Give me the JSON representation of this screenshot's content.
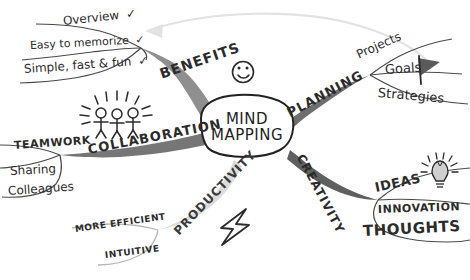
{
  "diagram": {
    "title": "Mind Mapping",
    "type": "hand-drawn mind map",
    "background_color": "#ffffff",
    "ink_color": "#2b2b2b",
    "branch_dark_color": "#6e6e6e",
    "branch_light_color": "#d8d8d8",
    "center": {
      "line1": "MIND",
      "line2": "MAPPING"
    },
    "branches": [
      {
        "label": "BENEFITS",
        "icon": "smiley-face-icon",
        "color": "#808080",
        "children": [
          {
            "label": "Overview",
            "mark": "✓"
          },
          {
            "label": "Easy to memorize",
            "mark": "✓"
          },
          {
            "label": "Simple, fast & fun",
            "mark": "✓"
          }
        ]
      },
      {
        "label": "PLANNING",
        "icon": "flag-icon",
        "color": "#6e6e6e",
        "children": [
          {
            "label": "Projects",
            "mark": ""
          },
          {
            "label": "Goals",
            "mark": ""
          },
          {
            "label": "Strategies",
            "mark": ""
          }
        ]
      },
      {
        "label": "CREATIVITY",
        "icon": "lightbulb-icon",
        "color": "#5f5f5f",
        "children": [
          {
            "label": "IDEAS",
            "mark": ""
          },
          {
            "label": "INNOVATION",
            "mark": ""
          },
          {
            "label": "THOUGHTS",
            "mark": ""
          }
        ]
      },
      {
        "label": "COLLABORATION",
        "icon": "three-people-icon",
        "color": "#767676",
        "children": [
          {
            "label": "TEAMWORK",
            "mark": ""
          },
          {
            "label": "Sharing",
            "mark": ""
          },
          {
            "label": "Colleagues",
            "mark": ""
          }
        ]
      },
      {
        "label": "PRODUCTIVITY",
        "icon": "lightning-bolt-icon",
        "color": "#dcdcdc",
        "children": [
          {
            "label": "MORE EFFICIENT",
            "mark": ""
          },
          {
            "label": "INTUITIVE",
            "mark": ""
          }
        ]
      }
    ],
    "decorations": [
      {
        "name": "smiley-face-icon",
        "glyph": "smiley"
      },
      {
        "name": "flag-icon",
        "glyph": "flag"
      },
      {
        "name": "lightbulb-icon",
        "glyph": "bulb"
      },
      {
        "name": "three-people-icon",
        "glyph": "people"
      },
      {
        "name": "lightning-bolt-icon",
        "glyph": "bolt"
      },
      {
        "name": "sweep-arrow-icon",
        "glyph": "arrow"
      }
    ]
  }
}
